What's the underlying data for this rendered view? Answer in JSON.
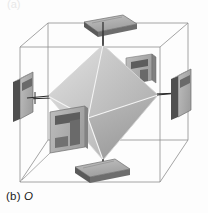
{
  "figure": {
    "caption_prefix": "(b)",
    "caption_symbol": "O",
    "caption_full": "(b) O",
    "partial_top_label": "(a)",
    "background_color": "#fdfdfd"
  },
  "diagram": {
    "type": "crystal-field-ligand-arrangement",
    "shape_name": "octahedron",
    "enclosing_shape": "cube",
    "ligand_count": 6,
    "colors": {
      "cube_edge": "#8a8a8a",
      "octa_face_light": "#dcdcdc",
      "octa_face_mid": "#c2c2c2",
      "octa_face_dark": "#a6a6a6",
      "octa_face_darkest": "#949494",
      "octa_edge": "#f2f2f2",
      "plate_top": "#b4b4b4",
      "plate_side": "#6f6f6f",
      "plate_dark": "#4f4f4f",
      "axis_line": "#2b2b2b"
    },
    "octahedron_vertices": {
      "top": [
        103,
        45
      ],
      "bottom": [
        103,
        160
      ],
      "left": [
        48,
        96
      ],
      "right": [
        158,
        95
      ],
      "front": [
        88,
        118
      ],
      "back": [
        122,
        92
      ]
    },
    "cube_vertices": {
      "back_top_left": [
        48,
        23
      ],
      "back_top_right": [
        188,
        23
      ],
      "back_bottom_left": [
        48,
        140
      ],
      "back_bottom_right": [
        188,
        140
      ],
      "front_top_left": [
        20,
        47
      ],
      "front_top_right": [
        160,
        47
      ],
      "front_bottom_left": [
        20,
        182
      ],
      "front_bottom_right": [
        160,
        182
      ]
    },
    "ligands": [
      {
        "name": "ligand-top",
        "position": "top",
        "orientation": "horizontal-plate"
      },
      {
        "name": "ligand-bottom",
        "position": "bottom",
        "orientation": "horizontal-plate"
      },
      {
        "name": "ligand-left",
        "position": "left",
        "orientation": "vertical-plate"
      },
      {
        "name": "ligand-right",
        "position": "right",
        "orientation": "vertical-plate"
      },
      {
        "name": "ligand-front-left",
        "position": "front",
        "orientation": "vertical-plate-face-on"
      },
      {
        "name": "ligand-back-right",
        "position": "back",
        "orientation": "vertical-plate-face-on"
      }
    ]
  }
}
